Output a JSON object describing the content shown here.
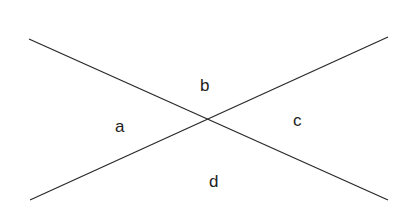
{
  "diagram": {
    "type": "intersecting-lines",
    "lines": [
      {
        "x1": 29,
        "y1": 39,
        "x2": 388,
        "y2": 200
      },
      {
        "x1": 30,
        "y1": 200,
        "x2": 388,
        "y2": 37
      }
    ],
    "labels": [
      {
        "id": "a",
        "text": "a",
        "x": 115,
        "y": 132
      },
      {
        "id": "b",
        "text": "b",
        "x": 200,
        "y": 91
      },
      {
        "id": "c",
        "text": "c",
        "x": 293,
        "y": 126
      },
      {
        "id": "d",
        "text": "d",
        "x": 209,
        "y": 187
      }
    ],
    "stroke_color": "#2a2a2a"
  }
}
